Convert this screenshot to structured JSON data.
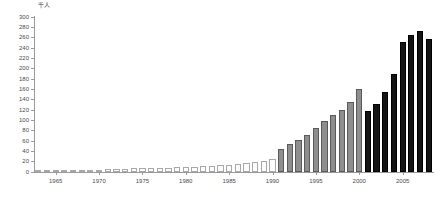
{
  "chart_data": {
    "type": "bar",
    "title": "",
    "xlabel": "",
    "ylabel": "",
    "unit_label": "千人",
    "ylim": [
      0,
      300
    ],
    "ytick_step": 20,
    "yticks": [
      0,
      20,
      40,
      60,
      80,
      100,
      120,
      140,
      160,
      180,
      200,
      220,
      240,
      260,
      280,
      300
    ],
    "xticks": [
      1965,
      1970,
      1975,
      1980,
      1985,
      1990,
      1995,
      2000,
      2005
    ],
    "xlim": [
      1962.5,
      2008.5
    ],
    "grid": false,
    "legend": "none",
    "series": [
      {
        "name": "white-group",
        "color": "#fdfdfd",
        "categories": [
          1963,
          1964,
          1965,
          1966,
          1967,
          1968,
          1969,
          1970,
          1971,
          1972,
          1973,
          1974,
          1975,
          1976,
          1977,
          1978,
          1979,
          1980,
          1981,
          1982,
          1983,
          1984,
          1985,
          1986,
          1987,
          1988,
          1989,
          1990
        ],
        "values": [
          1,
          1,
          1,
          1,
          2,
          2,
          2,
          3,
          5,
          6,
          6,
          7,
          7,
          8,
          8,
          8,
          9,
          9,
          10,
          11,
          12,
          13,
          14,
          15,
          17,
          19,
          22,
          26
        ]
      },
      {
        "name": "gray-group",
        "color": "#8e8e8e",
        "categories": [
          1991,
          1992,
          1993,
          1994,
          1995,
          1996,
          1997,
          1998,
          1999,
          2000
        ],
        "values": [
          44,
          54,
          62,
          72,
          85,
          98,
          110,
          120,
          135,
          160
        ]
      },
      {
        "name": "black-group",
        "color": "#141414",
        "categories": [
          2001,
          2002,
          2003,
          2004,
          2005,
          2006,
          2007,
          2008
        ],
        "values": [
          118,
          132,
          155,
          190,
          252,
          265,
          272,
          258
        ]
      }
    ]
  }
}
